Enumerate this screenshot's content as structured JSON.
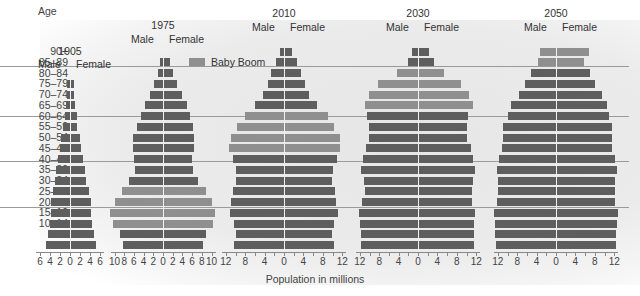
{
  "chart_data": {
    "type": "bar",
    "subtype": "population-pyramid",
    "xlabel": "Population in millions",
    "ylabel": "Age",
    "legend": [
      {
        "name": "Baby Boom",
        "color": "#8f8f8f"
      }
    ],
    "colors": {
      "normal": "#5e5e5e",
      "baby_boom": "#8f8f8f"
    },
    "age_groups": [
      "0–4",
      "5–9",
      "10–14",
      "15–19",
      "20–24",
      "25–29",
      "30–34",
      "35–39",
      "40–44",
      "45–49",
      "50–54",
      "55–59",
      "60–64",
      "65–69",
      "70–74",
      "75–79",
      "80–84",
      "85–89",
      "90+"
    ],
    "panels": [
      {
        "year": "1905",
        "male_label": "Male",
        "female_label": "Female",
        "xticks": [
          "6",
          "4",
          "2",
          "0",
          "2",
          "4",
          "6"
        ],
        "xlim": [
          -6,
          6
        ],
        "male": [
          4.8,
          4.4,
          4.0,
          3.9,
          3.8,
          3.5,
          3.1,
          2.9,
          2.4,
          2.0,
          1.8,
          1.4,
          1.1,
          0.9,
          0.6,
          0.6,
          0,
          0,
          0
        ],
        "female": [
          4.9,
          4.6,
          4.1,
          4.0,
          4.0,
          3.5,
          3.0,
          2.8,
          2.3,
          1.9,
          1.7,
          1.2,
          1.1,
          0.8,
          0.5,
          0.5,
          0,
          0,
          0
        ],
        "baby_boom_groups": []
      },
      {
        "year": "1975",
        "male_label": "Male",
        "female_label": "Female",
        "xticks": [
          "10",
          "8",
          "6",
          "4",
          "2",
          "0",
          "2",
          "4",
          "6",
          "8",
          "10"
        ],
        "xlim": [
          -10,
          10
        ],
        "male": [
          8.2,
          8.9,
          10.4,
          10.9,
          9.8,
          8.5,
          7.0,
          5.8,
          5.9,
          6.1,
          6.1,
          5.4,
          4.6,
          3.8,
          2.6,
          1.8,
          1.1,
          0.6,
          0
        ],
        "female": [
          8.0,
          8.6,
          10.2,
          10.5,
          9.8,
          8.6,
          7.0,
          5.9,
          5.7,
          6.1,
          6.1,
          5.9,
          5.3,
          4.8,
          3.7,
          2.7,
          1.9,
          1.2,
          0
        ],
        "baby_boom_groups": [
          "10–14",
          "15–19",
          "20–24",
          "25–29"
        ]
      },
      {
        "year": "2010",
        "male_label": "Male",
        "female_label": "Female",
        "xticks": [
          "12",
          "8",
          "4",
          "0",
          "4",
          "8",
          "12"
        ],
        "xlim": [
          -12,
          12
        ],
        "male": [
          10.4,
          10.0,
          10.4,
          11.2,
          11.0,
          10.6,
          9.9,
          10.0,
          10.6,
          11.3,
          11.0,
          9.6,
          8.0,
          5.9,
          4.4,
          3.4,
          2.7,
          1.6,
          0.9
        ],
        "female": [
          10.0,
          9.7,
          10.0,
          11.0,
          10.5,
          10.4,
          9.7,
          9.9,
          10.7,
          11.3,
          11.3,
          10.2,
          8.9,
          6.5,
          5.0,
          4.1,
          3.4,
          2.4,
          1.4
        ],
        "baby_boom_groups": [
          "45–49",
          "50–54",
          "55–59",
          "60–64"
        ]
      },
      {
        "year": "2030",
        "male_label": "Male",
        "female_label": "Female",
        "xticks": [
          "12",
          "8",
          "4",
          "0",
          "4",
          "8",
          "12"
        ],
        "xlim": [
          -12,
          12
        ],
        "male": [
          11.8,
          11.8,
          12.0,
          12.1,
          11.6,
          11.0,
          11.2,
          11.7,
          11.3,
          10.7,
          10.2,
          10.2,
          10.5,
          11.0,
          10.1,
          8.3,
          4.4,
          2.0,
          1.2
        ],
        "female": [
          11.3,
          11.3,
          11.4,
          11.5,
          11.0,
          10.9,
          11.1,
          11.6,
          11.2,
          10.8,
          9.8,
          9.8,
          10.1,
          11.1,
          10.3,
          8.7,
          5.2,
          3.0,
          2.0
        ],
        "baby_boom_groups": [
          "65–69",
          "70–74",
          "75–79",
          "80–84"
        ]
      },
      {
        "year": "2050",
        "male_label": "Male",
        "female_label": "Female",
        "xticks": [
          "12",
          "8",
          "4",
          "0",
          "4",
          "8",
          "12"
        ],
        "xlim": [
          -12,
          12
        ],
        "male": [
          12.4,
          12.6,
          12.6,
          12.8,
          12.2,
          11.9,
          11.9,
          12.2,
          11.8,
          11.2,
          11.0,
          10.9,
          9.9,
          9.2,
          7.7,
          6.4,
          5.1,
          3.8,
          3.2
        ],
        "female": [
          12.2,
          12.2,
          12.4,
          12.5,
          12.0,
          11.9,
          12.0,
          12.3,
          11.9,
          11.4,
          11.4,
          11.3,
          10.7,
          10.4,
          9.2,
          7.9,
          6.8,
          5.6,
          6.6
        ],
        "baby_boom_groups": [
          "85–89",
          "90+"
        ]
      }
    ]
  }
}
